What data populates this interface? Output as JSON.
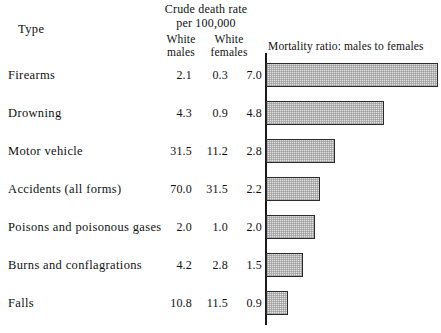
{
  "header": {
    "type_label": "Type",
    "crude_line1": "Crude death rate",
    "crude_line2": "per 100,000",
    "white_males_line1": "White",
    "white_males_line2": "males",
    "white_females_line1": "White",
    "white_females_line2": "females",
    "mortality_title": "Mortality ratio: males to females"
  },
  "colors": {
    "bar_fill": "#e2e2e2",
    "bar_border": "#2b2b2b",
    "axis": "#1a1a1a",
    "text": "#111111",
    "background": "#ffffff"
  },
  "chart_data": {
    "type": "bar",
    "orientation": "horizontal",
    "title": "Mortality ratio: males to females",
    "xlabel": "",
    "ylabel": "Type",
    "categories": [
      "Firearms",
      "Drowning",
      "Motor vehicle",
      "Accidents (all forms)",
      "Poisons and poisonous gases",
      "Burns and conflagrations",
      "Falls"
    ],
    "values": [
      7.0,
      4.8,
      2.8,
      2.2,
      2.0,
      1.5,
      0.9
    ],
    "xlim": [
      0,
      7.2
    ],
    "grid": false,
    "legend": "none",
    "series": [
      {
        "name": "White males",
        "values": [
          2.1,
          4.3,
          31.5,
          70.0,
          2.0,
          4.2,
          10.8
        ]
      },
      {
        "name": "White females",
        "values": [
          0.3,
          0.9,
          11.2,
          31.5,
          1.0,
          2.8,
          11.5
        ]
      },
      {
        "name": "Mortality ratio: males to females",
        "values": [
          7.0,
          4.8,
          2.8,
          2.2,
          2.0,
          1.5,
          0.9
        ]
      }
    ]
  },
  "rows": [
    {
      "type": "Firearms",
      "white_males": "2.1",
      "white_females": "0.3",
      "ratio": "7.0",
      "ratio_value": 7.0
    },
    {
      "type": "Drowning",
      "white_males": "4.3",
      "white_females": "0.9",
      "ratio": "4.8",
      "ratio_value": 4.8
    },
    {
      "type": "Motor vehicle",
      "white_males": "31.5",
      "white_females": "11.2",
      "ratio": "2.8",
      "ratio_value": 2.8
    },
    {
      "type": "Accidents (all forms)",
      "white_males": "70.0",
      "white_females": "31.5",
      "ratio": "2.2",
      "ratio_value": 2.2
    },
    {
      "type": "Poisons and poisonous gases",
      "white_males": "2.0",
      "white_females": "1.0",
      "ratio": "2.0",
      "ratio_value": 2.0
    },
    {
      "type": "Burns and conflagrations",
      "white_males": "4.2",
      "white_females": "2.8",
      "ratio": "1.5",
      "ratio_value": 1.5
    },
    {
      "type": "Falls",
      "white_males": "10.8",
      "white_females": "11.5",
      "ratio": "0.9",
      "ratio_value": 0.9
    }
  ]
}
